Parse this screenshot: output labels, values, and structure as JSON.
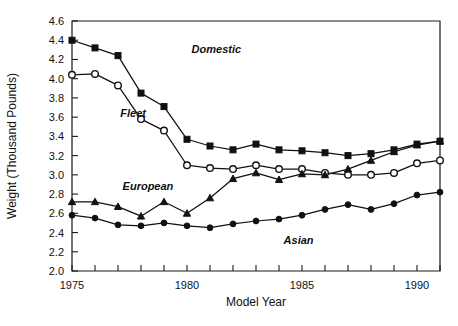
{
  "chart_data": {
    "type": "line",
    "title": "",
    "xlabel": "Model Year",
    "ylabel": "Weight (Thousand Pounds)",
    "xlim": [
      1975,
      1991
    ],
    "ylim": [
      2.0,
      4.6
    ],
    "grid": false,
    "legend_position": "inline-annotations",
    "x": [
      1975,
      1976,
      1977,
      1978,
      1979,
      1980,
      1981,
      1982,
      1983,
      1984,
      1985,
      1986,
      1987,
      1988,
      1989,
      1990,
      1991
    ],
    "xticks": [
      1975,
      1976,
      1977,
      1978,
      1979,
      1980,
      1981,
      1982,
      1983,
      1984,
      1985,
      1986,
      1987,
      1988,
      1989,
      1990,
      1991
    ],
    "xtick_labels": [
      "1975",
      "",
      "",
      "",
      "",
      "1980",
      "",
      "",
      "",
      "",
      "1985",
      "",
      "",
      "",
      "",
      "1990",
      ""
    ],
    "yticks": [
      2.0,
      2.2,
      2.4,
      2.6,
      2.8,
      3.0,
      3.2,
      3.4,
      3.6,
      3.8,
      4.0,
      4.2,
      4.4,
      4.6
    ],
    "ytick_labels": [
      "2.0",
      "2.2",
      "2.4",
      "2.6",
      "2.8",
      "3.0",
      "3.2",
      "3.4",
      "3.6",
      "3.8",
      "4.0",
      "4.2",
      "4.4",
      "4.6"
    ],
    "series": [
      {
        "name": "Domestic",
        "marker": "filled-square",
        "label_x": 1980.2,
        "label_y": 4.27,
        "values": [
          4.4,
          4.32,
          4.24,
          3.85,
          3.71,
          3.37,
          3.3,
          3.26,
          3.32,
          3.26,
          3.25,
          3.23,
          3.2,
          3.22,
          3.26,
          3.32,
          3.35
        ]
      },
      {
        "name": "Fleet",
        "marker": "open-circle",
        "label_x": 1977.1,
        "label_y": 3.6,
        "values": [
          4.04,
          4.05,
          3.93,
          3.58,
          3.46,
          3.1,
          3.07,
          3.06,
          3.1,
          3.06,
          3.06,
          3.02,
          3.0,
          3.0,
          3.02,
          3.12,
          3.15
        ]
      },
      {
        "name": "European",
        "marker": "filled-triangle",
        "label_x": 1977.2,
        "label_y": 2.84,
        "values": [
          2.72,
          2.72,
          2.67,
          2.57,
          2.72,
          2.6,
          2.76,
          2.96,
          3.02,
          2.95,
          3.01,
          3.0,
          3.06,
          3.15,
          3.24,
          3.31,
          3.35
        ]
      },
      {
        "name": "Asian",
        "marker": "filled-circle",
        "label_x": 1984.2,
        "label_y": 2.28,
        "values": [
          2.58,
          2.55,
          2.48,
          2.47,
          2.5,
          2.47,
          2.45,
          2.49,
          2.52,
          2.54,
          2.58,
          2.64,
          2.69,
          2.64,
          2.7,
          2.79,
          2.82
        ]
      }
    ]
  }
}
